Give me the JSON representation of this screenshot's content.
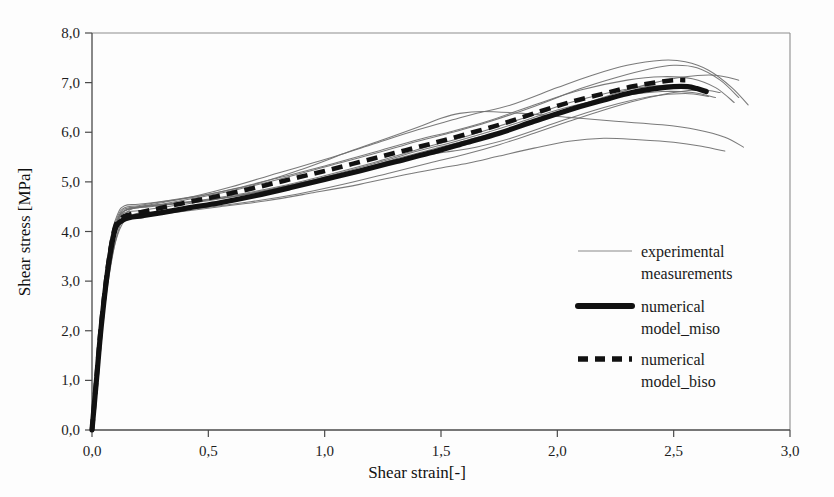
{
  "figure": {
    "background_color": "#fdfdfd",
    "frame_color": "#8d8d8d",
    "axis_color": "#4a4a4a"
  },
  "axes": {
    "y_title": "Shear stress [MPa]",
    "x_title": "Shear strain[-]",
    "y_ticks": [
      "0,0",
      "1,0",
      "2,0",
      "3,0",
      "4,0",
      "5,0",
      "6,0",
      "7,0",
      "8,0"
    ],
    "x_ticks": [
      "0,0",
      "0,5",
      "1,0",
      "1,5",
      "2,0",
      "2,5",
      "3,0"
    ]
  },
  "legend": {
    "items": [
      {
        "label_line1": "experimental",
        "label_line2": "measurements",
        "style": "thin-solid",
        "color": "#6f6f6f"
      },
      {
        "label_line1": "numerical",
        "label_line2": "model_miso",
        "style": "thick-solid",
        "color": "#111111"
      },
      {
        "label_line1": "numerical",
        "label_line2": "model_biso",
        "style": "thick-dashed",
        "color": "#111111"
      }
    ]
  },
  "chart_data": {
    "type": "line",
    "title": "",
    "xlabel": "Shear strain[-]",
    "ylabel": "Shear stress [MPa]",
    "xlim": [
      0.0,
      3.0
    ],
    "ylim": [
      0.0,
      8.0
    ],
    "xticks": [
      0.0,
      0.5,
      1.0,
      1.5,
      2.0,
      2.5,
      3.0
    ],
    "yticks": [
      0.0,
      1.0,
      2.0,
      3.0,
      4.0,
      5.0,
      6.0,
      7.0,
      8.0
    ],
    "grid": false,
    "legend_position": "inside-right-center",
    "series": [
      {
        "name": "experimental measurements",
        "kind": "experimental",
        "style": "thin-solid",
        "color": "#6f6f6f",
        "curves": [
          {
            "id": "exp-1",
            "x": [
              0.0,
              0.02,
              0.05,
              0.08,
              0.11,
              0.14,
              0.2,
              0.3,
              0.45,
              0.6,
              0.8,
              1.0,
              1.2,
              1.4,
              1.55,
              1.65,
              1.8,
              2.0,
              2.15,
              2.3,
              2.45,
              2.55,
              2.65,
              2.75,
              2.82
            ],
            "y": [
              0.0,
              1.1,
              2.6,
              3.7,
              4.25,
              4.45,
              4.5,
              4.58,
              4.72,
              4.9,
              5.18,
              5.45,
              5.75,
              6.05,
              6.25,
              6.38,
              6.55,
              6.9,
              7.15,
              7.35,
              7.45,
              7.42,
              7.25,
              6.9,
              6.55
            ]
          },
          {
            "id": "exp-2",
            "x": [
              0.0,
              0.02,
              0.05,
              0.08,
              0.11,
              0.14,
              0.2,
              0.3,
              0.45,
              0.6,
              0.8,
              1.0,
              1.2,
              1.4,
              1.55,
              1.7,
              1.9,
              2.1,
              2.25,
              2.4,
              2.5,
              2.6,
              2.7,
              2.78
            ],
            "y": [
              0.0,
              1.05,
              2.5,
              3.65,
              4.22,
              4.42,
              4.48,
              4.55,
              4.68,
              4.82,
              5.05,
              5.3,
              5.55,
              5.82,
              6.0,
              6.2,
              6.52,
              6.88,
              7.1,
              7.28,
              7.35,
              7.3,
              7.05,
              6.7
            ]
          },
          {
            "id": "exp-3",
            "x": [
              0.0,
              0.02,
              0.05,
              0.08,
              0.11,
              0.14,
              0.2,
              0.3,
              0.45,
              0.6,
              0.8,
              1.0,
              1.2,
              1.4,
              1.55,
              1.7,
              1.9,
              2.1,
              2.3,
              2.45,
              2.58,
              2.68,
              2.76
            ],
            "y": [
              0.0,
              1.15,
              2.7,
              3.8,
              4.3,
              4.48,
              4.52,
              4.6,
              4.7,
              4.85,
              5.08,
              5.32,
              5.58,
              5.85,
              6.02,
              6.22,
              6.55,
              6.85,
              7.05,
              7.12,
              7.08,
              6.9,
              6.6
            ]
          },
          {
            "id": "exp-4",
            "x": [
              0.0,
              0.02,
              0.05,
              0.08,
              0.11,
              0.14,
              0.2,
              0.32,
              0.5,
              0.7,
              0.9,
              1.1,
              1.3,
              1.45,
              1.55,
              1.65,
              1.8,
              2.0,
              2.2,
              2.4,
              2.55,
              2.65
            ],
            "y": [
              0.0,
              1.0,
              2.45,
              3.6,
              4.18,
              4.38,
              4.42,
              4.5,
              4.62,
              4.78,
              4.98,
              5.18,
              5.4,
              5.55,
              5.62,
              5.7,
              5.88,
              6.2,
              6.5,
              6.72,
              6.78,
              6.72
            ]
          },
          {
            "id": "exp-5",
            "x": [
              0.0,
              0.02,
              0.05,
              0.08,
              0.11,
              0.14,
              0.2,
              0.32,
              0.5,
              0.7,
              0.9,
              1.1,
              1.25,
              1.4,
              1.5,
              1.58,
              1.68,
              1.85,
              2.05,
              2.25,
              2.45,
              2.6,
              2.72,
              2.8
            ],
            "y": [
              0.0,
              1.2,
              2.75,
              3.85,
              4.35,
              4.52,
              4.55,
              4.62,
              4.75,
              4.95,
              5.25,
              5.6,
              5.85,
              6.1,
              6.28,
              6.38,
              6.42,
              6.38,
              6.3,
              6.22,
              6.15,
              6.05,
              5.9,
              5.7
            ]
          },
          {
            "id": "exp-6",
            "x": [
              0.0,
              0.02,
              0.05,
              0.08,
              0.11,
              0.14,
              0.22,
              0.38,
              0.55,
              0.75,
              0.95,
              1.15,
              1.35,
              1.5,
              1.62,
              1.75,
              1.9,
              2.05,
              2.2,
              2.35,
              2.5,
              2.62,
              2.72
            ],
            "y": [
              0.0,
              0.95,
              2.35,
              3.52,
              4.1,
              4.3,
              4.32,
              4.4,
              4.5,
              4.62,
              4.78,
              4.95,
              5.15,
              5.28,
              5.38,
              5.52,
              5.68,
              5.82,
              5.88,
              5.85,
              5.8,
              5.72,
              5.62
            ]
          },
          {
            "id": "exp-7",
            "x": [
              0.0,
              0.02,
              0.05,
              0.08,
              0.11,
              0.15,
              0.25,
              0.4,
              0.6,
              0.8,
              1.0,
              1.2,
              1.4,
              1.55,
              1.7,
              1.85,
              2.0,
              2.15,
              2.3,
              2.45,
              2.58,
              2.68
            ],
            "y": [
              0.0,
              1.08,
              2.55,
              3.68,
              4.24,
              4.44,
              4.5,
              4.58,
              4.7,
              4.88,
              5.1,
              5.35,
              5.62,
              5.8,
              6.0,
              6.22,
              6.45,
              6.62,
              6.75,
              6.82,
              6.8,
              6.7
            ]
          },
          {
            "id": "exp-8",
            "x": [
              0.0,
              0.02,
              0.05,
              0.08,
              0.12,
              0.16,
              0.26,
              0.42,
              0.62,
              0.82,
              1.02,
              1.22,
              1.42,
              1.58,
              1.72,
              1.88,
              2.02,
              2.18,
              2.32,
              2.48,
              2.6
            ],
            "y": [
              0.0,
              1.12,
              2.62,
              3.72,
              4.28,
              4.46,
              4.52,
              4.6,
              4.74,
              4.92,
              5.15,
              5.4,
              5.68,
              5.88,
              6.08,
              6.32,
              6.55,
              6.75,
              6.88,
              6.95,
              6.92
            ]
          },
          {
            "id": "exp-9",
            "x": [
              0.0,
              0.02,
              0.05,
              0.09,
              0.13,
              0.18,
              0.3,
              0.48,
              0.68,
              0.88,
              1.08,
              1.28,
              1.45,
              1.6,
              1.75,
              1.9,
              2.05,
              2.2,
              2.35,
              2.5,
              2.62,
              2.7
            ],
            "y": [
              0.0,
              0.98,
              2.4,
              3.58,
              4.15,
              4.35,
              4.4,
              4.48,
              4.6,
              4.75,
              4.95,
              5.18,
              5.38,
              5.55,
              5.75,
              5.98,
              6.22,
              6.45,
              6.65,
              6.8,
              6.85,
              6.8
            ]
          },
          {
            "id": "exp-10",
            "x": [
              0.0,
              0.02,
              0.06,
              0.1,
              0.14,
              0.2,
              0.34,
              0.52,
              0.72,
              0.92,
              1.12,
              1.32,
              1.48,
              1.62,
              1.78,
              1.95,
              2.1,
              2.25,
              2.4,
              2.55,
              2.68,
              2.78
            ],
            "y": [
              0.0,
              1.18,
              2.68,
              3.78,
              4.32,
              4.5,
              4.56,
              4.65,
              4.8,
              5.0,
              5.22,
              5.48,
              5.68,
              5.85,
              6.05,
              6.3,
              6.55,
              6.78,
              6.98,
              7.12,
              7.15,
              7.05
            ]
          }
        ]
      },
      {
        "name": "numerical model_miso",
        "kind": "model",
        "style": "thick-solid",
        "color": "#111111",
        "x": [
          0.0,
          0.02,
          0.04,
          0.07,
          0.1,
          0.13,
          0.16,
          0.22,
          0.3,
          0.42,
          0.55,
          0.7,
          0.85,
          1.0,
          1.15,
          1.3,
          1.45,
          1.6,
          1.75,
          1.9,
          2.05,
          2.2,
          2.32,
          2.42,
          2.5,
          2.56,
          2.6,
          2.64
        ],
        "y": [
          0.0,
          1.05,
          2.1,
          3.3,
          4.05,
          4.22,
          4.28,
          4.32,
          4.38,
          4.48,
          4.58,
          4.72,
          4.88,
          5.05,
          5.22,
          5.4,
          5.58,
          5.78,
          5.98,
          6.22,
          6.45,
          6.65,
          6.8,
          6.88,
          6.92,
          6.92,
          6.88,
          6.82
        ]
      },
      {
        "name": "numerical model_biso",
        "kind": "model",
        "style": "thick-dashed",
        "color": "#111111",
        "x": [
          0.0,
          0.02,
          0.04,
          0.07,
          0.1,
          0.13,
          0.16,
          0.22,
          0.3,
          0.42,
          0.55,
          0.7,
          0.85,
          1.0,
          1.15,
          1.3,
          1.45,
          1.6,
          1.75,
          1.9,
          2.05,
          2.2,
          2.32,
          2.42,
          2.5,
          2.55
        ],
        "y": [
          0.0,
          1.08,
          2.15,
          3.35,
          4.1,
          4.28,
          4.34,
          4.4,
          4.48,
          4.6,
          4.72,
          4.88,
          5.05,
          5.22,
          5.4,
          5.58,
          5.76,
          5.95,
          6.15,
          6.38,
          6.6,
          6.78,
          6.92,
          7.0,
          7.05,
          7.05
        ]
      }
    ]
  }
}
